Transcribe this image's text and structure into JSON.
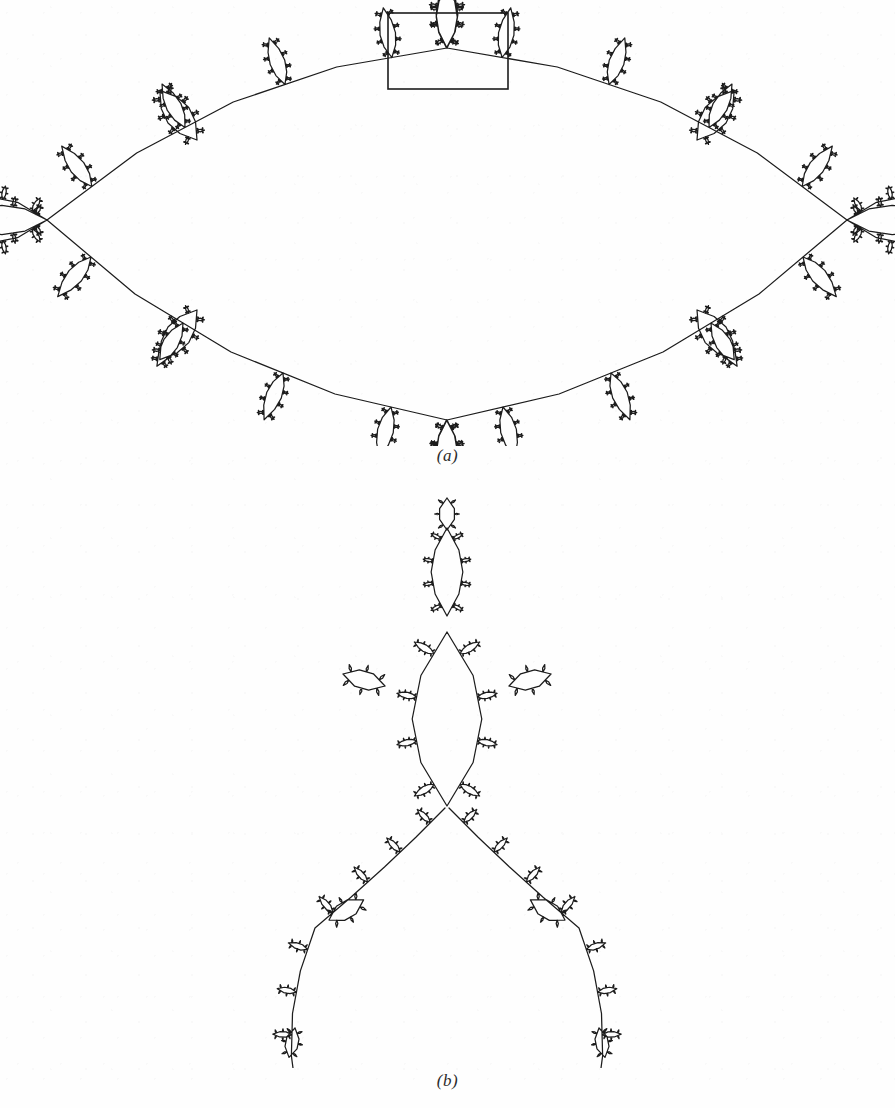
{
  "figure": {
    "kind": "fractal-limit-set-figure",
    "background_color": "#fefefe",
    "ink_color": "#1c1c1c",
    "panels": [
      {
        "id": "a",
        "caption": "(a)",
        "description": "Full self-similar limit-set curve with a rectangular detail box at the top apex",
        "detail_box": {
          "x": 388,
          "y": 13,
          "width": 120,
          "height": 76,
          "stroke": "#1c1c1c",
          "stroke_width": 1.6
        }
      },
      {
        "id": "b",
        "caption": "(b)",
        "description": "Magnification of the boxed region of panel (a)"
      }
    ]
  },
  "chart_data": {
    "type": "line",
    "title": "",
    "subtitle": "",
    "xlabel": "",
    "ylabel": "",
    "grid": false,
    "legend": null,
    "annotations": [
      {
        "text": "(a)",
        "x": 447,
        "y": 458,
        "style": "italic-serif"
      },
      {
        "text": "(b)",
        "x": 447,
        "y": 1083,
        "style": "italic-serif"
      }
    ],
    "series": [
      {
        "name": "limit-set-curve-a",
        "panel": "a",
        "stroke": "#1c1c1c",
        "stroke_width": 1.25,
        "generator": "recursive-arc-bud",
        "depth": 6,
        "bud_ratio": 0.3,
        "bud_angle_deg": 58,
        "arc_bulge": 0.22,
        "viewbox": [
          0,
          0,
          895,
          446
        ],
        "root_polygon_vertices": 4,
        "root_center": [
          447,
          222
        ],
        "root_radius_x": 408,
        "root_radius_y": 196,
        "root_rotation_deg": 0
      },
      {
        "name": "limit-set-curve-b",
        "panel": "b",
        "stroke": "#1c1c1c",
        "stroke_width": 1.25,
        "generator": "recursive-arc-bud",
        "depth": 6,
        "bud_ratio": 0.3,
        "bud_angle_deg": 58,
        "arc_bulge": 0.22,
        "viewbox": [
          0,
          0,
          895,
          590
        ],
        "note": "same generator, zoomed 4.0x on top apex of (a)",
        "zoom": 4.0,
        "zoom_center": [
          447,
          50
        ]
      }
    ]
  },
  "captions": {
    "a": "(a)",
    "b": "(b)"
  }
}
